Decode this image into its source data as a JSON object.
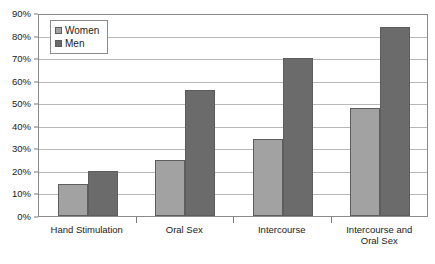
{
  "chart_data": {
    "type": "bar",
    "title": "",
    "subtitle": "",
    "xlabel": "",
    "ylabel": "",
    "categories": [
      "Hand Stimulation",
      "Oral Sex",
      "Intercourse",
      "Intercourse and\nOral Sex"
    ],
    "series": [
      {
        "name": "Women",
        "values": [
          14,
          25,
          34,
          48
        ],
        "color": "#a2a2a2"
      },
      {
        "name": "Men",
        "values": [
          20,
          56,
          70,
          84
        ],
        "color": "#6b6b6b"
      }
    ],
    "ylim": [
      0,
      90
    ],
    "ytick_step": 10,
    "ytick_labels": [
      "0%",
      "10%",
      "20%",
      "30%",
      "40%",
      "50%",
      "60%",
      "70%",
      "80%",
      "90%"
    ],
    "ytick_values": [
      0,
      10,
      20,
      30,
      40,
      50,
      60,
      70,
      80,
      90
    ],
    "grid": true,
    "grid_axis": "y",
    "legend_position": "top-left-inside",
    "value_suffix": "%"
  },
  "legend": {
    "items": [
      {
        "label": "Women",
        "swatch": "women"
      },
      {
        "label": "Men",
        "swatch": "men"
      }
    ]
  },
  "xlabels": [
    {
      "line1": "Hand Stimulation",
      "line2": ""
    },
    {
      "line1": "Oral Sex",
      "line2": ""
    },
    {
      "line1": "Intercourse",
      "line2": ""
    },
    {
      "line1": "Intercourse and",
      "line2": "Oral Sex"
    }
  ],
  "colors": {
    "women": "#a2a2a2",
    "men": "#6b6b6b",
    "gridline": "#b8b8b8",
    "border": "#8a8a8a",
    "text": "#1a1a1a",
    "background": "#ffffff"
  }
}
